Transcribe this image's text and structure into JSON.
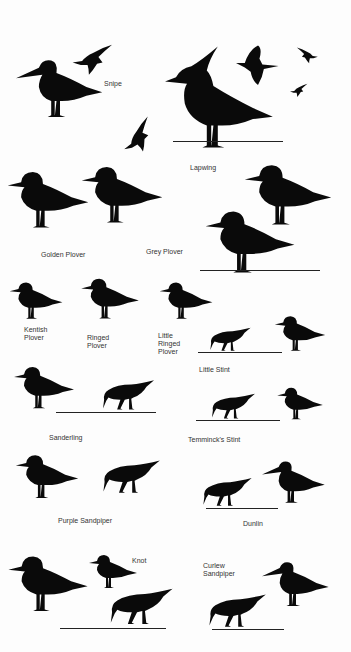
{
  "plate": {
    "background": "#fdfdfd",
    "silhouette_color": "#0a0a0a",
    "label_color": "#333333"
  },
  "labels": {
    "snipe": "Snipe",
    "lapwing": "Lapwing",
    "golden_plover": "Golden Plover",
    "grey_plover": "Grey Plover",
    "kentish_plover": "Kentish\nPlover",
    "ringed_plover": "Ringed\nPlover",
    "little_ringed_plover": "Little\nRinged\nPlover",
    "little_stint": "Little Stint",
    "sanderling": "Sanderling",
    "temmincks_stint": "Temminck's Stint",
    "purple_sandpiper": "Purple Sandpiper",
    "dunlin": "Dunlin",
    "knot": "Knot",
    "curlew_sandpiper": "Curlew\nSandpiper"
  }
}
